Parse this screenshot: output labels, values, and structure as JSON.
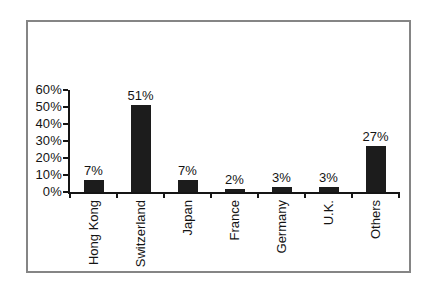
{
  "chart_data": {
    "type": "bar",
    "categories": [
      "Hong Kong",
      "Switzerland",
      "Japan",
      "France",
      "Germany",
      "U.K.",
      "Others"
    ],
    "values": [
      7,
      51,
      7,
      2,
      3,
      3,
      27
    ],
    "data_labels": [
      "7%",
      "51%",
      "7%",
      "2%",
      "3%",
      "3%",
      "27%"
    ],
    "yticks": [
      0,
      10,
      20,
      30,
      40,
      50,
      60
    ],
    "ytick_labels": [
      "0%",
      "10%",
      "20%",
      "30%",
      "40%",
      "50%",
      "60%"
    ],
    "ylim": [
      0,
      60
    ],
    "title": "",
    "xlabel": "",
    "ylabel": "",
    "grid": false,
    "legend": "none",
    "bar_color": "#1c1c1c",
    "axis_color": "#151515",
    "frame_border_color": "#858585",
    "background_color": "#ffffff"
  }
}
